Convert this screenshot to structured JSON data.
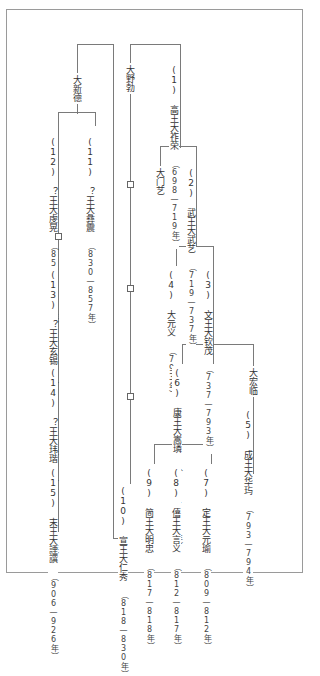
{
  "diagram": {
    "title": "",
    "nodes": {
      "da_xinde": {
        "name": "大新德"
      },
      "da_yebo": {
        "name": "大野勃"
      },
      "n1": {
        "label": "(1) 高王大祚荣",
        "dates": "（698—719年）"
      },
      "n2": {
        "label": "(2) 武王大武艺",
        "dates": "（719—737年）"
      },
      "da_menyi": {
        "name": "大门艺"
      },
      "n3": {
        "label": "(3) 文王大钦茂",
        "dates": "（737—793年）"
      },
      "n4": {
        "label": "(4) 大元义",
        "dates": "（793年）"
      },
      "da_hongling": {
        "name": "大宏临"
      },
      "n5": {
        "label": "(5) 成王大华玙",
        "dates": "（793—794年）"
      },
      "n6": {
        "label": "(6) 康王大嵩璘",
        "dates": "（794—809年）"
      },
      "n7": {
        "label": "(7) 定王大元瑜",
        "dates": "（809—812年）"
      },
      "n8": {
        "label": "(8) 僖王大言义",
        "dates": "（812—817年）"
      },
      "n9": {
        "label": "(9) 简王大明忠",
        "dates": "（817—818年）"
      },
      "n10": {
        "label": "(10) 宣王大仁秀",
        "dates": "（818—830年）"
      },
      "n11": {
        "label": "(11) ？王大彝震",
        "dates": "（830—857年）"
      },
      "n12": {
        "label": "(12) ？王大虔晃",
        "dates": "（857—871年）"
      },
      "n13": {
        "label": "(13) ？王大玄锡",
        "dates": "（871—893年）"
      },
      "n14": {
        "label": "(14) ？王大玮瑎",
        "dates": "（893—906年）"
      },
      "n15": {
        "label": "(15) 末王大諲譔",
        "dates": "（906—926年）"
      }
    },
    "unknown_marker": "□"
  }
}
